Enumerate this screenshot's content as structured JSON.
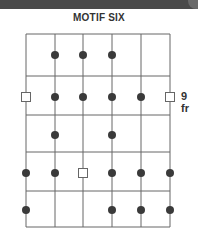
{
  "title": "MOTIF SIX",
  "fret_label": "9 fr",
  "colors": {
    "line": "#666666",
    "dot": "#3a3a3a",
    "band": "#4a4a4a"
  },
  "grid": {
    "strings_x": [
      26,
      55,
      83,
      112,
      141,
      170
    ],
    "frets_y": [
      34,
      76,
      115,
      152,
      191,
      227
    ]
  },
  "rows": [
    {
      "y": 55,
      "markers": [
        {
          "string": 2,
          "type": "dot"
        },
        {
          "string": 3,
          "type": "dot"
        },
        {
          "string": 4,
          "type": "dot"
        }
      ]
    },
    {
      "y": 97,
      "markers": [
        {
          "string": 1,
          "type": "square"
        },
        {
          "string": 2,
          "type": "dot"
        },
        {
          "string": 3,
          "type": "dot"
        },
        {
          "string": 4,
          "type": "dot"
        },
        {
          "string": 5,
          "type": "dot"
        },
        {
          "string": 6,
          "type": "square"
        }
      ]
    },
    {
      "y": 135,
      "markers": [
        {
          "string": 2,
          "type": "dot"
        },
        {
          "string": 4,
          "type": "dot"
        }
      ]
    },
    {
      "y": 173,
      "markers": [
        {
          "string": 1,
          "type": "dot"
        },
        {
          "string": 2,
          "type": "dot"
        },
        {
          "string": 3,
          "type": "square"
        },
        {
          "string": 4,
          "type": "dot"
        },
        {
          "string": 5,
          "type": "dot"
        },
        {
          "string": 6,
          "type": "dot"
        }
      ]
    },
    {
      "y": 210,
      "markers": [
        {
          "string": 1,
          "type": "dot"
        },
        {
          "string": 4,
          "type": "dot"
        },
        {
          "string": 5,
          "type": "dot"
        },
        {
          "string": 6,
          "type": "dot"
        }
      ]
    }
  ]
}
